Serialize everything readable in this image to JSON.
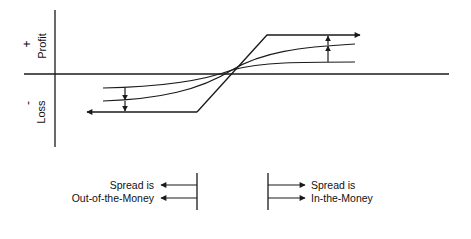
{
  "diagram": {
    "type": "payoff-diagram",
    "axis": {
      "y_positive_sign": "+",
      "y_positive_label": "Profit",
      "y_negative_sign": "-",
      "y_negative_label": "Loss"
    },
    "curves": [
      {
        "name": "limit-line",
        "description": "outer piecewise line with arrows at both ends"
      },
      {
        "name": "steeper-curve",
        "description": "middle S-curve"
      },
      {
        "name": "flatter-curve",
        "description": "inner flatter S-curve"
      }
    ],
    "annotations": {
      "left": {
        "line1": "Spread is",
        "line2": "Out-of-the-Money",
        "direction": "left"
      },
      "right": {
        "line1": "Spread is",
        "line2": "In-the-Money",
        "direction": "right"
      }
    },
    "colors": {
      "ink": "#1a1a1a",
      "background": "#ffffff"
    }
  }
}
